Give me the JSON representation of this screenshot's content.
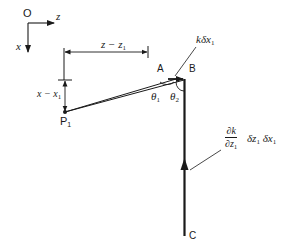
{
  "diagram": {
    "title": "",
    "axes": {
      "origin_label": "O",
      "z_label": "z",
      "x_label": "x"
    },
    "dimensions": {
      "horizontal": "z − z",
      "horizontal_sub": "1",
      "vertical": "x − x",
      "vertical_sub": "1"
    },
    "points": {
      "P_label": "P",
      "P_sub": "1",
      "A_label": "A",
      "B_label": "B",
      "C_label": "C"
    },
    "angles": {
      "theta1": "θ",
      "theta1_sub": "1",
      "theta2": "θ",
      "theta2_sub": "2"
    },
    "annotations": {
      "top_vector": "kδx",
      "top_vector_sub": "1",
      "side_num": "∂k",
      "side_den": "∂z",
      "side_den_sub": "1",
      "side_rest_1": "δz",
      "side_rest_1_sub": "1",
      "side_rest_2": "δx",
      "side_rest_2_sub": "1"
    },
    "colors": {
      "ink": "#1a1a1a",
      "background": "#ffffff"
    }
  }
}
